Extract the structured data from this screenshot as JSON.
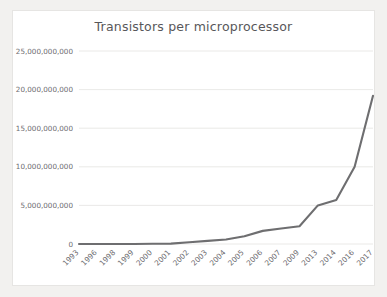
{
  "card": {
    "background_color": "#ffffff",
    "border_color": "#e6e5e3"
  },
  "page": {
    "background_color": "#f2f1ef"
  },
  "chart_data": {
    "type": "line",
    "title": "Transistors per microprocessor",
    "xlabel": "",
    "ylabel": "",
    "grid": true,
    "legend": "none",
    "line_color": "#6e6e70",
    "text_color": "#6d6c70",
    "gridline_color": "#e4e3e1",
    "categories": [
      "1993",
      "1996",
      "1998",
      "1999",
      "2000",
      "2001",
      "2002",
      "2003",
      "2004",
      "2005",
      "2006",
      "2007",
      "2009",
      "2013",
      "2014",
      "2016",
      "2017"
    ],
    "values": [
      0,
      0,
      0,
      0,
      0,
      0,
      0,
      0,
      0,
      0,
      0,
      0,
      0,
      0,
      0,
      0,
      0
    ],
    "series": [
      {
        "name": "Transistors per microprocessor",
        "values": [
          3100000,
          7500000,
          9500000,
          9500000,
          42000000,
          45000000,
          220000000,
          410000000,
          592000000,
          1000000000,
          1700000000,
          2000000000,
          2300000000,
          5000000000,
          5700000000,
          10000000000,
          19200000000
        ]
      }
    ],
    "ylim": [
      0,
      25000000000
    ],
    "yticks": [
      0,
      5000000000,
      10000000000,
      15000000000,
      20000000000,
      25000000000
    ],
    "ytick_labels": [
      "0",
      "5,000,000,000",
      "10,000,000,000",
      "15,000,000,000",
      "20,000,000,000",
      "25,000,000,000"
    ],
    "xtick_labels": [
      "1993",
      "1996",
      "1998",
      "1999",
      "2000",
      "2001",
      "2002",
      "2003",
      "2004",
      "2005",
      "2006",
      "2007",
      "2009",
      "2013",
      "2014",
      "2016",
      "2017"
    ]
  }
}
